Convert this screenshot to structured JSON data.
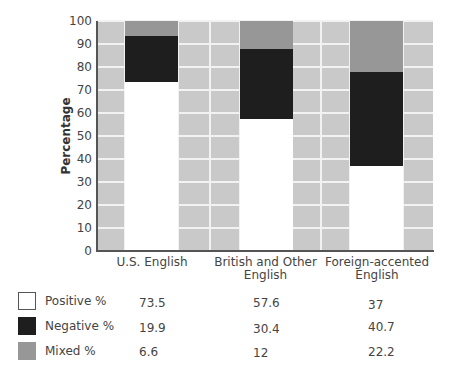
{
  "chart_data": {
    "type": "bar",
    "stacked": true,
    "title": "",
    "xlabel": "",
    "ylabel": "Percentage",
    "ylim": [
      0,
      100
    ],
    "yticks": [
      0,
      10,
      20,
      30,
      40,
      50,
      60,
      70,
      80,
      90,
      100
    ],
    "grid": true,
    "categories": [
      "U.S. English",
      "British and Other English",
      "Foreign-accented English"
    ],
    "category_labels_display": [
      "U.S. English",
      "British and Other\nEnglish",
      "Foreign-accented\nEnglish"
    ],
    "series": [
      {
        "name": "Positive %",
        "color": "#ffffff",
        "values": [
          73.5,
          57.6,
          37
        ]
      },
      {
        "name": "Negative %",
        "color": "#1e1e1e",
        "values": [
          19.9,
          30.4,
          40.7
        ]
      },
      {
        "name": "Mixed %",
        "color": "#979797",
        "values": [
          6.6,
          12,
          22.2
        ]
      }
    ],
    "legend_position": "bottom-table"
  },
  "colors": {
    "plot_background": "#c9c9c9",
    "gridline": "#f2f2f2",
    "axis": "#555555"
  },
  "table": {
    "rows": [
      {
        "label": "Positive %",
        "values": [
          "73.5",
          "57.6",
          "37"
        ]
      },
      {
        "label": "Negative %",
        "values": [
          "19.9",
          "30.4",
          "40.7"
        ]
      },
      {
        "label": "Mixed %",
        "values": [
          "6.6",
          "12",
          "22.2"
        ]
      }
    ]
  }
}
